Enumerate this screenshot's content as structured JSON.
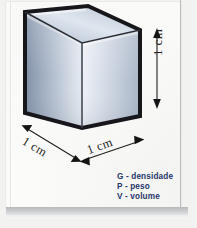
{
  "figure": {
    "type": "geometry-illustration",
    "shape_name": "cube"
  },
  "dimensions": {
    "height_label": "1 cm",
    "depth_label": "1 cm",
    "width_label": "1 cm",
    "unit": "cm",
    "value": 1
  },
  "legend": {
    "items": [
      {
        "symbol": "G",
        "separator": "-",
        "term": "densidade",
        "text": "G - densidade"
      },
      {
        "symbol": "P",
        "separator": "-",
        "term": "peso",
        "text": "P - peso"
      },
      {
        "symbol": "V",
        "separator": "-",
        "term": "volume",
        "text": "V - volume"
      }
    ]
  },
  "colors": {
    "legend_text": "#27376b",
    "cube_outline": "#17171b",
    "cube_top_light": "#e9eef5",
    "cube_top_dark": "#8d9bb0",
    "cube_left_light": "#cfd7e2",
    "cube_left_dark": "#7e8ea6",
    "cube_right_light": "#eef1f6",
    "cube_right_dark": "#9aa8bc",
    "paper": "#fbfbfa",
    "shadow_band": "#b7b9bb",
    "dimension_text": "#1d1d1d"
  }
}
